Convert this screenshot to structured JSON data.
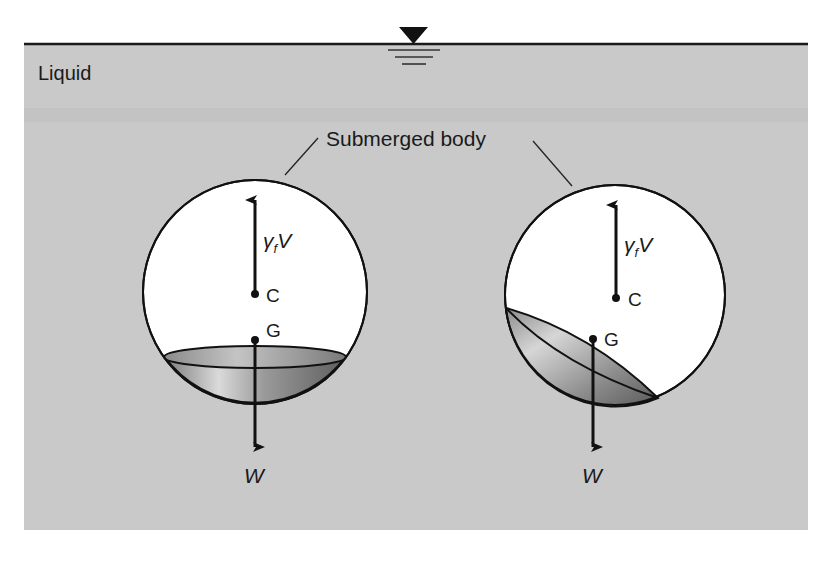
{
  "labels": {
    "liquid": "Liquid",
    "submerged_body": "Submerged body",
    "buoyant_force_symbol": "γ",
    "buoyant_force_subscript": "f",
    "buoyant_force_volume": "V",
    "center_of_buoyancy": "C",
    "center_of_gravity": "G",
    "weight": "W"
  },
  "colors": {
    "liquid": "#c9c9c9",
    "surface_line": "#1a1a1a",
    "body_fill": "#ffffff",
    "ballast_dark": "#6e6e6e",
    "ballast_light": "#d8d8d8",
    "stroke": "#111111"
  },
  "bodies": [
    {
      "name": "stable-upright",
      "cx": 255,
      "cy": 292,
      "r": 113
    },
    {
      "name": "tilted",
      "cx": 615,
      "cy": 295,
      "r": 111
    }
  ]
}
